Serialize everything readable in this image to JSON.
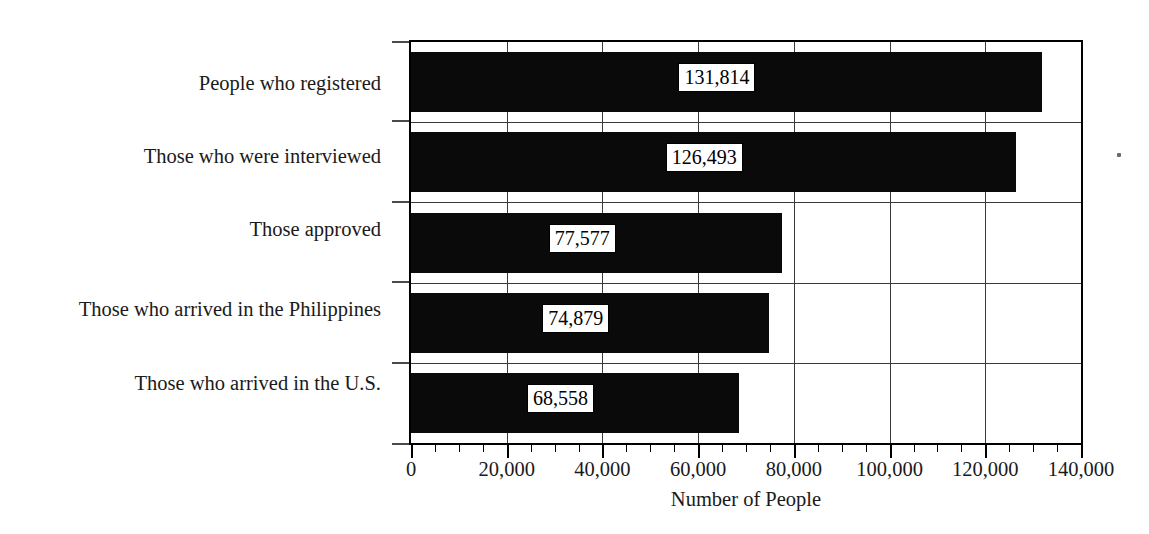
{
  "chart_data": {
    "type": "bar",
    "orientation": "horizontal",
    "title": "",
    "xlabel": "Number of People",
    "ylabel": "",
    "categories": [
      "People who registered",
      "Those who were interviewed",
      "Those approved",
      "Those who arrived in the Philippines",
      "Those who arrived in the U.S."
    ],
    "values": [
      131814,
      126493,
      77577,
      74879,
      68558
    ],
    "value_labels": [
      "131,814",
      "126,493",
      "77,577",
      "74,879",
      "68,558"
    ],
    "xlim": [
      0,
      140000
    ],
    "xticks": [
      0,
      20000,
      40000,
      60000,
      80000,
      100000,
      120000,
      140000
    ],
    "xtick_labels": [
      "0",
      "20,000",
      "40,000",
      "60,000",
      "80,000",
      "100,000",
      "120,000",
      "140,000"
    ],
    "minor_tick_step": 5000,
    "grid": "both",
    "legend": "none",
    "bar_color": "#0a0a0a",
    "value_label_style": "white-box-inside-bar"
  },
  "axis": {
    "x_title": "Number of People"
  }
}
